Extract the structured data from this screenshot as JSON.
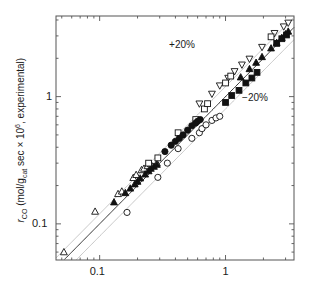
{
  "figure": {
    "width": 310,
    "height": 294,
    "background": "#ffffff"
  },
  "axes": {
    "frame": {
      "left": 56,
      "right": 294,
      "top": 16,
      "bottom": 260
    },
    "line_color": "#555555",
    "parity_line_color": "#1a1a1a",
    "band_line_color": "#b8b8b8"
  },
  "chart_data": {
    "type": "scatter",
    "title": "",
    "xlabel": "",
    "ylabel": "rCO (mol/gcat sec × 10^6, experimental)",
    "xscale": "log",
    "yscale": "log",
    "xlim": [
      0.045,
      3.5
    ],
    "ylim": [
      0.052,
      4.3
    ],
    "xticks": [
      0.1,
      1
    ],
    "xtick_labels": [
      "0.1",
      "1"
    ],
    "yticks": [
      0.1,
      1
    ],
    "ytick_labels": [
      "0.1",
      "1"
    ],
    "grid": false,
    "legend": "none",
    "annotations": [
      {
        "text": "+20%",
        "x": 0.46,
        "y": 2.55
      },
      {
        "text": "−20%",
        "x": 1.75,
        "y": 0.98
      }
    ],
    "reference_lines": [
      {
        "name": "parity",
        "slope": 1.0,
        "intercept_factor": 1.0,
        "style": "solid",
        "color": "#1a1a1a"
      },
      {
        "name": "plus20",
        "slope": 1.0,
        "intercept_factor": 1.2,
        "style": "solid",
        "color": "#b8b8b8"
      },
      {
        "name": "minus20",
        "slope": 1.0,
        "intercept_factor": 0.8,
        "style": "solid",
        "color": "#b8b8b8"
      }
    ],
    "series": [
      {
        "name": "open-up-triangle",
        "marker": "triangle-up",
        "fill": "open",
        "points": [
          [
            0.052,
            0.06
          ],
          [
            0.092,
            0.125
          ],
          [
            0.14,
            0.172
          ],
          [
            0.15,
            0.18
          ],
          [
            0.185,
            0.23
          ],
          [
            0.195,
            0.243
          ],
          [
            0.215,
            0.265
          ],
          [
            0.225,
            0.272
          ],
          [
            0.24,
            0.285
          ],
          [
            0.255,
            0.295
          ],
          [
            0.285,
            0.3
          ]
        ]
      },
      {
        "name": "filled-up-triangle",
        "marker": "triangle-up",
        "fill": "filled",
        "points": [
          [
            0.13,
            0.148
          ],
          [
            0.16,
            0.175
          ],
          [
            0.175,
            0.19
          ],
          [
            0.19,
            0.205
          ],
          [
            0.2,
            0.215
          ],
          [
            0.21,
            0.228
          ],
          [
            0.23,
            0.245
          ],
          [
            0.245,
            0.26
          ],
          [
            0.255,
            0.272
          ],
          [
            0.27,
            0.282
          ],
          [
            0.285,
            0.292
          ],
          [
            1.32,
            1.42
          ],
          [
            1.55,
            1.65
          ],
          [
            1.75,
            1.85
          ],
          [
            1.95,
            2.05
          ],
          [
            2.3,
            2.4
          ],
          [
            2.55,
            2.65
          ],
          [
            2.8,
            2.9
          ],
          [
            3.0,
            3.1
          ],
          [
            3.15,
            3.25
          ]
        ]
      },
      {
        "name": "open-down-triangle",
        "marker": "triangle-down",
        "fill": "open",
        "points": [
          [
            0.62,
            0.88
          ],
          [
            0.78,
            1.05
          ],
          [
            0.9,
            1.22
          ],
          [
            1.05,
            1.4
          ],
          [
            1.18,
            1.58
          ],
          [
            1.35,
            1.78
          ],
          [
            1.55,
            1.98
          ],
          [
            1.95,
            2.45
          ],
          [
            2.45,
            3.15
          ],
          [
            2.9,
            3.55
          ],
          [
            3.15,
            3.8
          ]
        ]
      },
      {
        "name": "open-square",
        "marker": "square",
        "fill": "open",
        "points": [
          [
            0.245,
            0.3
          ],
          [
            0.29,
            0.33
          ],
          [
            0.42,
            0.52
          ],
          [
            0.58,
            0.66
          ],
          [
            0.68,
            0.8
          ],
          [
            0.72,
            0.88
          ],
          [
            1.0,
            1.28
          ],
          [
            1.1,
            1.45
          ],
          [
            2.3,
            2.95
          ]
        ]
      },
      {
        "name": "filled-square",
        "marker": "square",
        "fill": "filled",
        "points": [
          [
            1.0,
            0.9
          ],
          [
            1.12,
            1.02
          ],
          [
            1.28,
            1.12
          ],
          [
            1.45,
            1.28
          ],
          [
            1.62,
            1.4
          ],
          [
            1.78,
            1.55
          ],
          [
            2.55,
            2.62
          ],
          [
            2.8,
            2.85
          ],
          [
            3.05,
            3.05
          ]
        ]
      },
      {
        "name": "open-circle",
        "marker": "circle",
        "fill": "open",
        "points": [
          [
            0.165,
            0.123
          ],
          [
            0.29,
            0.232
          ],
          [
            0.345,
            0.3
          ],
          [
            0.42,
            0.39
          ],
          [
            0.54,
            0.47
          ],
          [
            0.62,
            0.52
          ],
          [
            0.65,
            0.56
          ],
          [
            0.7,
            0.6
          ],
          [
            0.78,
            0.65
          ],
          [
            0.84,
            0.68
          ],
          [
            0.9,
            0.7
          ]
        ]
      },
      {
        "name": "filled-circle",
        "marker": "circle",
        "fill": "filled",
        "points": [
          [
            0.33,
            0.37
          ],
          [
            0.37,
            0.415
          ],
          [
            0.4,
            0.445
          ],
          [
            0.43,
            0.47
          ],
          [
            0.46,
            0.5
          ],
          [
            0.5,
            0.545
          ],
          [
            0.54,
            0.59
          ],
          [
            0.58,
            0.62
          ],
          [
            0.6,
            0.64
          ],
          [
            0.63,
            0.66
          ]
        ]
      }
    ]
  },
  "ylabel_parts": {
    "r": "r",
    "sub_co": "CO",
    "mid": " (mol/g",
    "sub_cat": "cat",
    "mid2": " sec × 10",
    "sup_6": "6",
    "tail": ", experimental)"
  },
  "xtick_labels": {
    "t0": "0.1",
    "t1": "1"
  },
  "ytick_labels": {
    "t0": "0.1",
    "t1": "1"
  },
  "annotations": {
    "plus20": "+20%",
    "minus20": "−20%"
  }
}
